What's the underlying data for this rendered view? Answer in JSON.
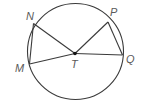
{
  "diagram": {
    "center": {
      "label": "T"
    },
    "points": [
      {
        "id": "N",
        "label": "N"
      },
      {
        "id": "M",
        "label": "M"
      },
      {
        "id": "P",
        "label": "P"
      },
      {
        "id": "Q",
        "label": "Q"
      }
    ],
    "chords": [
      [
        "M",
        "N"
      ],
      [
        "P",
        "Q"
      ]
    ],
    "radii": [
      [
        "T",
        "N"
      ],
      [
        "T",
        "M"
      ],
      [
        "T",
        "P"
      ],
      [
        "T",
        "Q"
      ]
    ],
    "colors": {
      "line": "#3a3a3a",
      "label": "#5a5a5a"
    }
  }
}
